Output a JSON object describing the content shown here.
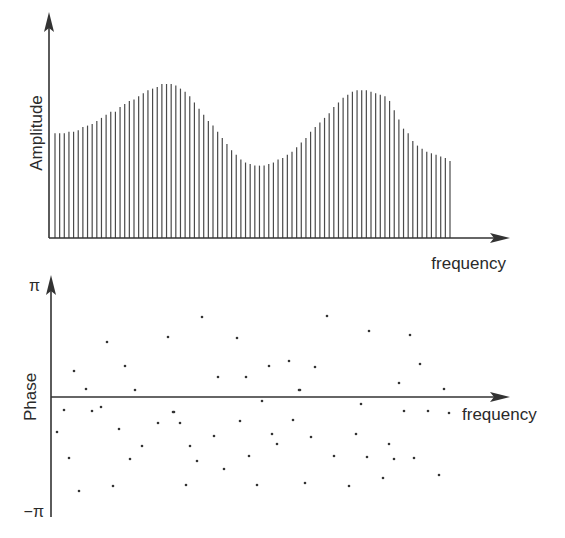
{
  "chart_data": [
    {
      "type": "bar",
      "title": "",
      "xlabel": "frequency",
      "ylabel": "Amplitude",
      "grid": false,
      "legend": null,
      "ylim": [
        0,
        1
      ],
      "description": "Amplitude spectrum shown as ~86 closely spaced vertical lines (stem plot). Envelope: starts moderate, rises to a first peak, dips to a trough, rises to a second peak, then decays to a lower tail.",
      "x_index": [
        0,
        1,
        2,
        3,
        4,
        5,
        6,
        7,
        8,
        9,
        10,
        11,
        12,
        13,
        14,
        15,
        16,
        17,
        18,
        19,
        20,
        21,
        22,
        23,
        24,
        25,
        26,
        27,
        28,
        29,
        30,
        31,
        32,
        33,
        34,
        35,
        36,
        37,
        38,
        39,
        40,
        41,
        42,
        43,
        44,
        45,
        46,
        47,
        48,
        49,
        50,
        51,
        52,
        53,
        54,
        55,
        56,
        57,
        58,
        59,
        60,
        61,
        62,
        63,
        64,
        65,
        66,
        67,
        68,
        69,
        70,
        71,
        72,
        73,
        74,
        75,
        76,
        77,
        78,
        79,
        80,
        81,
        82,
        83,
        84,
        85
      ],
      "values": [
        0.68,
        0.68,
        0.68,
        0.69,
        0.69,
        0.7,
        0.72,
        0.73,
        0.74,
        0.76,
        0.78,
        0.8,
        0.82,
        0.82,
        0.85,
        0.87,
        0.89,
        0.9,
        0.92,
        0.94,
        0.96,
        0.97,
        0.98,
        1.0,
        1.0,
        1.0,
        0.99,
        0.97,
        0.95,
        0.92,
        0.88,
        0.84,
        0.8,
        0.76,
        0.73,
        0.69,
        0.65,
        0.61,
        0.57,
        0.54,
        0.51,
        0.49,
        0.48,
        0.47,
        0.47,
        0.47,
        0.48,
        0.49,
        0.51,
        0.52,
        0.54,
        0.56,
        0.59,
        0.62,
        0.65,
        0.69,
        0.72,
        0.75,
        0.78,
        0.81,
        0.85,
        0.88,
        0.91,
        0.93,
        0.95,
        0.96,
        0.96,
        0.96,
        0.95,
        0.94,
        0.93,
        0.92,
        0.89,
        0.83,
        0.77,
        0.71,
        0.68,
        0.63,
        0.6,
        0.58,
        0.56,
        0.55,
        0.54,
        0.53,
        0.52,
        0.5
      ]
    },
    {
      "type": "scatter",
      "title": "",
      "xlabel": "frequency",
      "ylabel": "Phase",
      "grid": false,
      "legend": null,
      "yticks": [
        "π",
        "−π"
      ],
      "ylim": [
        -3.14159,
        3.14159
      ],
      "description": "Phase spectrum: one dot per frequency component, values scattered randomly between −π and π around a horizontal zero axis.",
      "points_px": [
        [
          57,
          432
        ],
        [
          64,
          410
        ],
        [
          69,
          458
        ],
        [
          74,
          371
        ],
        [
          79,
          491
        ],
        [
          86,
          389
        ],
        [
          92,
          411
        ],
        [
          101,
          407
        ],
        [
          107,
          342
        ],
        [
          113,
          486
        ],
        [
          119,
          429
        ],
        [
          125,
          366
        ],
        [
          130,
          459
        ],
        [
          135,
          390
        ],
        [
          142,
          446
        ],
        [
          158,
          423
        ],
        [
          168,
          337
        ],
        [
          173,
          412
        ],
        [
          174,
          412
        ],
        [
          180,
          423
        ],
        [
          186,
          485
        ],
        [
          190,
          446
        ],
        [
          197,
          461
        ],
        [
          202,
          317
        ],
        [
          214,
          436
        ],
        [
          218,
          377
        ],
        [
          224,
          469
        ],
        [
          237,
          338
        ],
        [
          240,
          421
        ],
        [
          246,
          377
        ],
        [
          249,
          456
        ],
        [
          257,
          485
        ],
        [
          262,
          401
        ],
        [
          269,
          366
        ],
        [
          272,
          434
        ],
        [
          277,
          444
        ],
        [
          289,
          361
        ],
        [
          293,
          420
        ],
        [
          299,
          390
        ],
        [
          300,
          390
        ],
        [
          305,
          483
        ],
        [
          311,
          437
        ],
        [
          315,
          367
        ],
        [
          327,
          316
        ],
        [
          334,
          456
        ],
        [
          349,
          486
        ],
        [
          356,
          434
        ],
        [
          361,
          404
        ],
        [
          367,
          457
        ],
        [
          369,
          331
        ],
        [
          383,
          478
        ],
        [
          389,
          444
        ],
        [
          394,
          459
        ],
        [
          399,
          383
        ],
        [
          404,
          411
        ],
        [
          410,
          335
        ],
        [
          414,
          458
        ],
        [
          420,
          364
        ],
        [
          428,
          411
        ],
        [
          439,
          475
        ],
        [
          444,
          389
        ],
        [
          449,
          413
        ]
      ]
    }
  ],
  "labels": {
    "amplitude_ylabel": "Amplitude",
    "amplitude_xlabel": "frequency",
    "phase_ylabel": "Phase",
    "phase_xlabel": "frequency",
    "phase_top_tick": "π",
    "phase_bottom_tick": "−π"
  },
  "colors": {
    "axis": "#333333",
    "bars": "#4a4a4a",
    "dots": "#333333",
    "background": "#ffffff"
  }
}
